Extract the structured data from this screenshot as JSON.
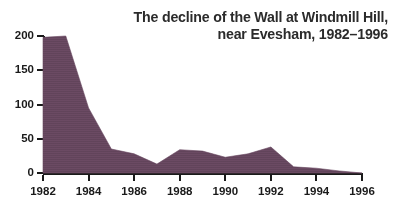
{
  "chart_data": {
    "type": "area",
    "title": "The decline of the Wall at Windmill Hill,\nnear Evesham, 1982–1996",
    "title_line1": "The decline of the Wall at Windmill Hill,",
    "title_line2": "near Evesham, 1982–1996",
    "xlabel": "",
    "ylabel": "",
    "xlim": [
      1982,
      1996
    ],
    "ylim": [
      0,
      200
    ],
    "grid": false,
    "legend": "none",
    "fill_color": "#6b4a63",
    "axis_color": "#1a1a1a",
    "text_color": "#2b2b2b",
    "background": "#ffffff",
    "x": [
      1982,
      1983,
      1984,
      1985,
      1986,
      1987,
      1988,
      1989,
      1990,
      1991,
      1992,
      1993,
      1994,
      1995,
      1996
    ],
    "values": [
      198,
      200,
      95,
      35,
      28,
      13,
      34,
      32,
      23,
      28,
      38,
      9,
      7,
      3,
      0
    ],
    "series": [
      {
        "name": "Wall length remaining",
        "values": [
          198,
          200,
          95,
          35,
          28,
          13,
          34,
          32,
          23,
          28,
          38,
          9,
          7,
          3,
          0
        ]
      }
    ],
    "x_ticks": [
      1982,
      1984,
      1986,
      1988,
      1990,
      1992,
      1994,
      1996
    ],
    "x_tick_labels": [
      "1982",
      "1984",
      "1986",
      "1988",
      "1990",
      "1992",
      "1994",
      "1996"
    ],
    "y_ticks": [
      0,
      50,
      100,
      150,
      200
    ],
    "y_tick_labels": [
      "0",
      "50",
      "100",
      "150",
      "200"
    ]
  }
}
